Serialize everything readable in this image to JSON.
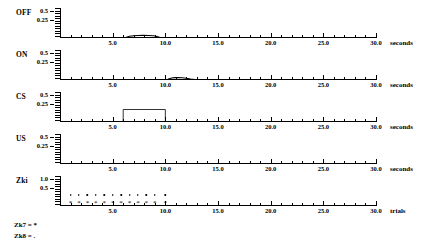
{
  "figure": {
    "panels": [
      {
        "name": "OFF",
        "row_label": "OFF",
        "unit_label": "seconds",
        "y_ticks": [
          "0.5",
          "0.25"
        ],
        "y_values": [
          0.5,
          0.25
        ],
        "ylim": [
          0,
          0.6
        ],
        "xlim": [
          0,
          30
        ],
        "x_ticks": [
          "5.0",
          "10.0",
          "15.0",
          "20.0",
          "25.0",
          "30.0"
        ],
        "x_tick_values": [
          5,
          10,
          15,
          20,
          25,
          30
        ],
        "trace_type": "line",
        "trace_points": [
          [
            0,
            0
          ],
          [
            6.0,
            0
          ],
          [
            6.3,
            0.015
          ],
          [
            6.6,
            0.035
          ],
          [
            7.0,
            0.045
          ],
          [
            7.4,
            0.05
          ],
          [
            7.9,
            0.052
          ],
          [
            8.4,
            0.05
          ],
          [
            8.9,
            0.045
          ],
          [
            9.2,
            0.03
          ],
          [
            9.5,
            0.01
          ],
          [
            9.7,
            0
          ],
          [
            30,
            0
          ]
        ]
      },
      {
        "name": "ON",
        "row_label": "ON",
        "unit_label": "seconds",
        "y_ticks": [
          "0.5",
          "0.25"
        ],
        "y_values": [
          0.5,
          0.25
        ],
        "ylim": [
          0,
          0.6
        ],
        "xlim": [
          0,
          30
        ],
        "x_ticks": [
          "5.0",
          "10.0",
          "15.0",
          "20.0",
          "25.0",
          "30.0"
        ],
        "x_tick_values": [
          5,
          10,
          15,
          20,
          25,
          30
        ],
        "trace_type": "line",
        "trace_points": [
          [
            0,
            0
          ],
          [
            10.1,
            0
          ],
          [
            10.3,
            0.02
          ],
          [
            10.6,
            0.04
          ],
          [
            10.9,
            0.048
          ],
          [
            11.2,
            0.05
          ],
          [
            11.6,
            0.045
          ],
          [
            12.0,
            0.035
          ],
          [
            12.4,
            0.02
          ],
          [
            12.8,
            0.008
          ],
          [
            13.1,
            0
          ],
          [
            30,
            0
          ]
        ]
      },
      {
        "name": "CS",
        "row_label": "CS",
        "unit_label": "seconds",
        "y_ticks": [
          "0.5",
          "0.25"
        ],
        "y_values": [
          0.5,
          0.25
        ],
        "ylim": [
          0,
          0.6
        ],
        "xlim": [
          0,
          30
        ],
        "x_ticks": [
          "5.0",
          "10.0",
          "15.0",
          "20.0",
          "25.0",
          "30.0"
        ],
        "x_tick_values": [
          5,
          10,
          15,
          20,
          25,
          30
        ],
        "trace_type": "step",
        "trace_points": [
          [
            0,
            0
          ],
          [
            6.0,
            0
          ],
          [
            6.0,
            0.25
          ],
          [
            10.0,
            0.25
          ],
          [
            10.0,
            0
          ],
          [
            30,
            0
          ]
        ]
      },
      {
        "name": "US",
        "row_label": "US",
        "unit_label": "seconds",
        "y_ticks": [
          "0.5",
          "0.25"
        ],
        "y_values": [
          0.5,
          0.25
        ],
        "ylim": [
          0,
          0.6
        ],
        "xlim": [
          0,
          30
        ],
        "x_ticks": [
          "5.0",
          "10.0",
          "15.0",
          "20.0",
          "25.0",
          "30.0"
        ],
        "x_tick_values": [
          5,
          10,
          15,
          20,
          25,
          30
        ],
        "trace_type": "line",
        "trace_points": [
          [
            0,
            0
          ],
          [
            30,
            0
          ]
        ]
      },
      {
        "name": "Zki",
        "row_label": "Zki",
        "unit_label": "trials",
        "y_ticks": [
          "1.0",
          "0.5"
        ],
        "y_values": [
          1.0,
          0.5
        ],
        "ylim": [
          0,
          1.2
        ],
        "xlim": [
          0,
          30
        ],
        "x_ticks": [
          "5.0",
          "10.0",
          "15.0",
          "20.0",
          "25.0",
          "30.0"
        ],
        "x_tick_values": [
          5,
          10,
          15,
          20,
          25,
          30
        ],
        "trace_type": "markers",
        "series": [
          {
            "name": "Zk7",
            "marker": "*",
            "x": [
              1.0,
              1.8,
              2.6,
              3.4,
              4.2,
              5.0,
              5.8,
              6.6,
              7.4,
              8.2,
              9.0,
              10.0
            ],
            "y": [
              0.04,
              0.04,
              0.04,
              0.04,
              0.04,
              0.04,
              0.04,
              0.04,
              0.04,
              0.04,
              0.04,
              0.04
            ]
          },
          {
            "name": "Zk8",
            "marker": ".",
            "x": [
              1.0,
              1.8,
              2.6,
              3.4,
              4.2,
              5.0,
              5.8,
              6.6,
              7.4,
              8.2,
              9.0,
              10.0
            ],
            "y": [
              0.42,
              0.42,
              0.42,
              0.42,
              0.42,
              0.42,
              0.42,
              0.42,
              0.42,
              0.42,
              0.42,
              0.42
            ]
          }
        ]
      }
    ],
    "legend": [
      {
        "key": "Zk7",
        "text": "Zk7 = *"
      },
      {
        "key": "Zk8",
        "text": "Zk8 = ."
      }
    ]
  },
  "chart_data": {
    "type": "line",
    "title": "",
    "xlabel": "seconds",
    "ylabel": "",
    "xlim": [
      0,
      30
    ],
    "grid": false,
    "legend_position": "below-plot",
    "panels": [
      {
        "label": "OFF",
        "ylabel": "",
        "ylim": [
          0,
          0.6
        ],
        "yticks": [
          0.25,
          0.5
        ],
        "xunit": "seconds",
        "x": [
          0,
          6.0,
          6.3,
          6.6,
          7.0,
          7.4,
          7.9,
          8.4,
          8.9,
          9.2,
          9.5,
          9.7,
          30
        ],
        "y": [
          0,
          0,
          0.015,
          0.035,
          0.045,
          0.05,
          0.052,
          0.05,
          0.045,
          0.03,
          0.01,
          0,
          0
        ]
      },
      {
        "label": "ON",
        "ylabel": "",
        "ylim": [
          0,
          0.6
        ],
        "yticks": [
          0.25,
          0.5
        ],
        "xunit": "seconds",
        "x": [
          0,
          10.1,
          10.3,
          10.6,
          10.9,
          11.2,
          11.6,
          12.0,
          12.4,
          12.8,
          13.1,
          30
        ],
        "y": [
          0,
          0,
          0.02,
          0.04,
          0.048,
          0.05,
          0.045,
          0.035,
          0.02,
          0.008,
          0,
          0
        ]
      },
      {
        "label": "CS",
        "ylabel": "",
        "ylim": [
          0,
          0.6
        ],
        "yticks": [
          0.25,
          0.5
        ],
        "xunit": "seconds",
        "x": [
          0,
          6.0,
          6.0,
          10.0,
          10.0,
          30
        ],
        "y": [
          0,
          0,
          0.25,
          0.25,
          0,
          0
        ]
      },
      {
        "label": "US",
        "ylabel": "",
        "ylim": [
          0,
          0.6
        ],
        "yticks": [
          0.25,
          0.5
        ],
        "xunit": "seconds",
        "x": [
          0,
          30
        ],
        "y": [
          0,
          0
        ]
      },
      {
        "label": "Zki",
        "ylabel": "",
        "ylim": [
          0,
          1.2
        ],
        "yticks": [
          0.5,
          1.0
        ],
        "xunit": "trials",
        "series": [
          {
            "name": "Zk7",
            "marker": "*",
            "x": [
              1.0,
              1.8,
              2.6,
              3.4,
              4.2,
              5.0,
              5.8,
              6.6,
              7.4,
              8.2,
              9.0,
              10.0
            ],
            "values": [
              0.04,
              0.04,
              0.04,
              0.04,
              0.04,
              0.04,
              0.04,
              0.04,
              0.04,
              0.04,
              0.04,
              0.04
            ]
          },
          {
            "name": "Zk8",
            "marker": ".",
            "x": [
              1.0,
              1.8,
              2.6,
              3.4,
              4.2,
              5.0,
              5.8,
              6.6,
              7.4,
              8.2,
              9.0,
              10.0
            ],
            "values": [
              0.42,
              0.42,
              0.42,
              0.42,
              0.42,
              0.42,
              0.42,
              0.42,
              0.42,
              0.42,
              0.42,
              0.42
            ]
          }
        ]
      }
    ]
  }
}
